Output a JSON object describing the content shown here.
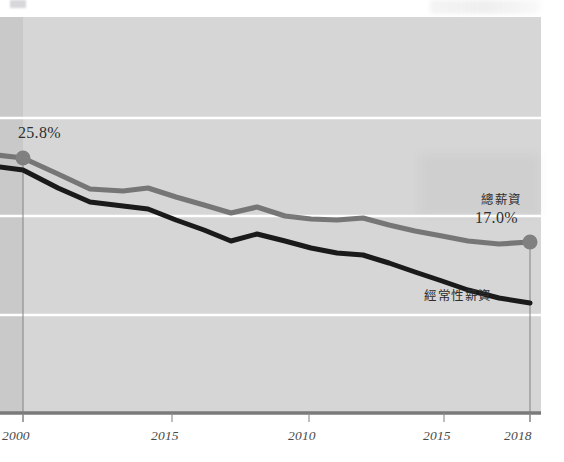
{
  "chart_data": {
    "type": "line",
    "title": "",
    "subtitle": "",
    "xlabel": "",
    "ylabel": "",
    "grid": true,
    "legend_position": "inline-right",
    "x_tick_labels": [
      "2000",
      "2015",
      "2010",
      "2015",
      "2018"
    ],
    "x_tick_positions_px": [
      23,
      172,
      309,
      444,
      530
    ],
    "gridline_y_px": [
      118,
      216,
      315
    ],
    "axis_baseline_y_px": 413,
    "plot_top_y_px": 17,
    "plot_right_x_px": 541,
    "ylim": [
      10,
      30
    ],
    "annotations": [
      {
        "name": "start-value",
        "text": "25.8%",
        "x_px": 18,
        "y_px": 124
      },
      {
        "name": "end-value",
        "text": "17.0%",
        "x_px": 475,
        "y_px": 209
      },
      {
        "name": "series-label-total",
        "text": "總薪資",
        "x_px": 481,
        "y_px": 189
      },
      {
        "name": "series-label-regular",
        "text": "經常性薪資",
        "x_px": 424,
        "y_px": 285
      }
    ],
    "series": [
      {
        "name": "總薪資",
        "label": "總薪資",
        "color": "#6e6e6e",
        "start_value": "25.8%",
        "end_value": "17.0%",
        "marker_points": [
          {
            "label": "2000",
            "value": 25.8
          },
          {
            "label": "2018",
            "value": 17.0
          }
        ],
        "x": [
          2000,
          2001,
          2002,
          2003,
          2004,
          2005,
          2006,
          2007,
          2008,
          2009,
          2010,
          2011,
          2012,
          2013,
          2014,
          2015,
          2016,
          2017,
          2018
        ],
        "values": [
          25.8,
          24.6,
          23.3,
          23.0,
          22.9,
          22.3,
          21.6,
          20.9,
          21.4,
          20.6,
          20.3,
          20.2,
          20.4,
          19.8,
          19.3,
          18.8,
          18.2,
          17.6,
          17.0
        ],
        "points_px": [
          [
            23,
            158
          ],
          [
            58,
            174
          ],
          [
            90,
            189
          ],
          [
            123,
            191
          ],
          [
            148,
            188
          ],
          [
            176,
            197
          ],
          [
            204,
            205
          ],
          [
            231,
            213
          ],
          [
            257,
            207
          ],
          [
            285,
            216
          ],
          [
            311,
            219
          ],
          [
            337,
            220
          ],
          [
            363,
            218
          ],
          [
            389,
            225
          ],
          [
            415,
            231
          ],
          [
            442,
            236
          ],
          [
            468,
            241
          ],
          [
            499,
            244
          ],
          [
            530,
            242
          ]
        ]
      },
      {
        "name": "經常性薪資",
        "label": "經常性薪資",
        "color": "#1a1a1a",
        "x": [
          2000,
          2001,
          2002,
          2003,
          2004,
          2005,
          2006,
          2007,
          2008,
          2009,
          2010,
          2011,
          2012,
          2013,
          2014,
          2015,
          2016,
          2017,
          2018
        ],
        "values": [
          24.8,
          23.4,
          22.3,
          21.9,
          21.5,
          20.6,
          19.8,
          19.0,
          19.5,
          18.9,
          18.4,
          18.1,
          18.0,
          17.4,
          16.8,
          16.2,
          15.7,
          15.2,
          14.9
        ],
        "points_px": [
          [
            23,
            170
          ],
          [
            58,
            188
          ],
          [
            90,
            202
          ],
          [
            123,
            206
          ],
          [
            148,
            209
          ],
          [
            176,
            220
          ],
          [
            204,
            230
          ],
          [
            231,
            241
          ],
          [
            257,
            234
          ],
          [
            285,
            241
          ],
          [
            311,
            248
          ],
          [
            337,
            253
          ],
          [
            363,
            255
          ],
          [
            389,
            263
          ],
          [
            415,
            272
          ],
          [
            442,
            281
          ],
          [
            468,
            290
          ],
          [
            499,
            298
          ],
          [
            530,
            303
          ]
        ]
      }
    ],
    "marker_dots": [
      {
        "name": "start-dot",
        "x_px": 23,
        "y_px": 158,
        "color": "#808080",
        "r": 7.5
      },
      {
        "name": "end-dot",
        "x_px": 530,
        "y_px": 242,
        "color": "#808080",
        "r": 7.5
      }
    ],
    "colors": {
      "plot_background": "#d6d6d6",
      "left_band": "#c9c9c9",
      "gridline": "#ffffff",
      "axis": "#7a7a7a",
      "series_total": "#6e6e6e",
      "series_regular": "#1a1a1a",
      "text": "#333333",
      "tick_text": "#4a4a4a"
    }
  }
}
